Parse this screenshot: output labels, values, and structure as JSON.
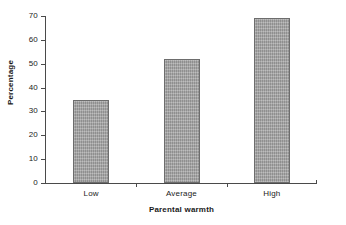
{
  "chart_data": {
    "type": "bar",
    "title": "",
    "subtitle": "",
    "categories": [
      "Low",
      "Average",
      "High"
    ],
    "values": [
      35,
      52,
      69
    ],
    "xlabel": "Parental warmth",
    "ylabel": "Percentage",
    "ylim": [
      0,
      70
    ],
    "yticks": [
      0,
      10,
      20,
      30,
      40,
      50,
      60,
      70
    ],
    "ytick_labels": [
      "0",
      "10",
      "20",
      "30",
      "40",
      "50",
      "60",
      "70"
    ],
    "grid": false,
    "legend": false,
    "legend_position": "none",
    "bar_color": "#9d9d9d",
    "bar_edge_color": "#6d6d6d",
    "axis_color": "#4a4a4a",
    "background_color": "#ffffff"
  }
}
